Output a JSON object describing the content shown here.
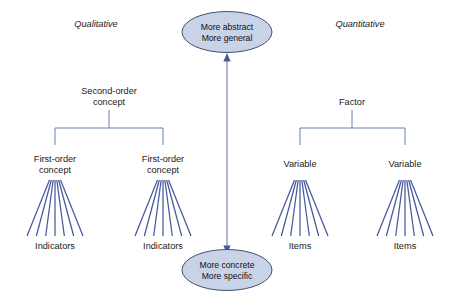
{
  "figure": {
    "background_color": "#ffffff",
    "line_color": "#46589b",
    "connector_color": "#5b6fa8",
    "ellipse_fill": "#c8d3e8",
    "ellipse_stroke": "#33405e",
    "text_color": "#1a1a1a"
  },
  "headings": {
    "left": "Qualitative",
    "right": "Quantitative"
  },
  "poles": {
    "top": {
      "line1": "More abstract",
      "line2": "More general"
    },
    "bottom": {
      "line1": "More concrete",
      "line2": "More specific"
    }
  },
  "qualitative": {
    "root": {
      "line1": "Second-order",
      "line2": "concept"
    },
    "children": [
      {
        "line1": "First-order",
        "line2": "concept",
        "leaf_label": "Indicators",
        "fan_count": 7
      },
      {
        "line1": "First-order",
        "line2": "concept",
        "leaf_label": "Indicators",
        "fan_count": 7
      }
    ]
  },
  "quantitative": {
    "root": {
      "line1": "Factor",
      "line2": ""
    },
    "children": [
      {
        "line1": "Variable",
        "line2": "",
        "leaf_label": "Items",
        "fan_count": 7
      },
      {
        "line1": "Variable",
        "line2": "",
        "leaf_label": "Items",
        "fan_count": 7
      }
    ]
  }
}
